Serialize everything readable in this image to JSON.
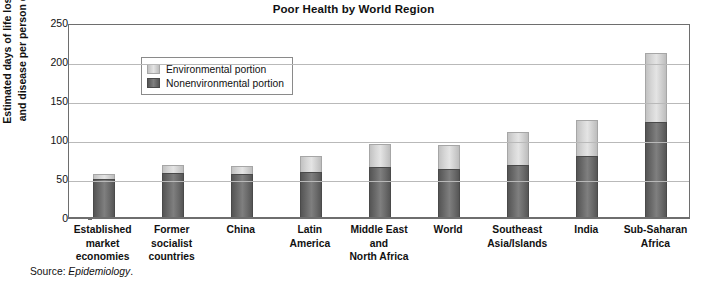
{
  "chart_data": {
    "type": "bar",
    "stacked": true,
    "title": "Poor Health by World Region",
    "xlabel": "",
    "ylabel": "Estimated days of life lost to death and disease per person each year",
    "ylabel_lines": [
      "Estimated days of life lost to death",
      "and disease per person each year"
    ],
    "ylim": [
      0,
      250
    ],
    "yticks": [
      250,
      200,
      150,
      100,
      50,
      0
    ],
    "grid": true,
    "legend_position": "top-left",
    "categories": [
      "Established market economies",
      "Former socialist countries",
      "China",
      "Latin America",
      "Middle East and North Africa",
      "World",
      "Southeast Asia/Islands",
      "India",
      "Sub-Saharan Africa"
    ],
    "category_label_lines": [
      [
        "Established",
        "market",
        "economies"
      ],
      [
        "Former",
        "socialist",
        "countries"
      ],
      [
        "China"
      ],
      [
        "Latin",
        "America"
      ],
      [
        "Middle East",
        "and",
        "North Africa"
      ],
      [
        "World"
      ],
      [
        "Southeast",
        "Asia/Islands"
      ],
      [
        "India"
      ],
      [
        "Sub-Saharan",
        "Africa"
      ]
    ],
    "series": [
      {
        "name": "Nonenvironmental portion",
        "color": "#6b6b6b",
        "values": [
          50,
          58,
          57,
          59,
          66,
          63,
          68,
          80,
          123
        ]
      },
      {
        "name": "Environmental portion",
        "color": "#d6d6d6",
        "values": [
          6,
          10,
          10,
          21,
          29,
          31,
          42,
          46,
          88
        ]
      }
    ],
    "totals": [
      56,
      68,
      67,
      80,
      95,
      94,
      110,
      126,
      211
    ],
    "source": {
      "prefix": "Source: ",
      "italic": "Epidemiology",
      "suffix": "."
    }
  },
  "legend": {
    "items": [
      {
        "label": "Environmental portion",
        "swatch": "light-gray"
      },
      {
        "label": "Nonenvironmental portion",
        "swatch": "dark-gray"
      }
    ]
  }
}
